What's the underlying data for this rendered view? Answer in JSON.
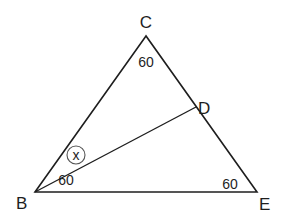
{
  "figure": {
    "type": "geometry-triangle",
    "vertices": {
      "C": {
        "label": "C"
      },
      "B": {
        "label": "B"
      },
      "E": {
        "label": "E"
      },
      "D": {
        "label": "D"
      }
    },
    "angles": {
      "C": "60",
      "B_lower": "60",
      "E": "60",
      "unknown": "x"
    },
    "segments": [
      "BC",
      "CE",
      "BE",
      "BD"
    ],
    "colors": {
      "stroke": "#1e1e1e",
      "background": "#ffffff"
    }
  }
}
